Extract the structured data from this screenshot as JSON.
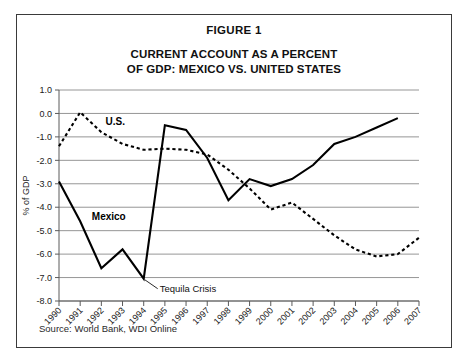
{
  "figure": {
    "label": "FIGURE 1",
    "title_line1": "CURRENT ACCOUNT AS A PERCENT",
    "title_line2": "OF GDP: MEXICO VS. UNITED STATES",
    "source": "Source: World Bank, WDI Online"
  },
  "chart_data": {
    "type": "line",
    "title": "CURRENT ACCOUNT AS A PERCENT OF GDP: MEXICO VS. UNITED STATES",
    "subtitle": "FIGURE 1",
    "xlabel": "",
    "ylabel": "% of GDP",
    "grid": true,
    "legend": "inline-series-labels",
    "ylim": [
      -8.0,
      1.0
    ],
    "ytick_labels": [
      "1.0",
      "0.0",
      "-1.0",
      "-2.0",
      "-3.0",
      "-4.0",
      "-5.0",
      "-6.0",
      "-7.0",
      "-8.0"
    ],
    "ytick_values": [
      1.0,
      0.0,
      -1.0,
      -2.0,
      -3.0,
      -4.0,
      -5.0,
      -6.0,
      -7.0,
      -8.0
    ],
    "categories": [
      "1990",
      "1991",
      "1992",
      "1993",
      "1994",
      "1995",
      "1996",
      "1997",
      "1998",
      "1999",
      "2000",
      "2001",
      "2002",
      "2003",
      "2004",
      "2005",
      "2006",
      "2007"
    ],
    "x": [
      1990,
      1991,
      1992,
      1993,
      1994,
      1995,
      1996,
      1997,
      1998,
      1999,
      2000,
      2001,
      2002,
      2003,
      2004,
      2005,
      2006,
      2007
    ],
    "series": [
      {
        "name": "Mexico",
        "style": "solid",
        "label": "Mexico",
        "values": [
          -2.9,
          -4.6,
          -6.6,
          -5.8,
          -7.05,
          -0.5,
          -0.7,
          -1.9,
          -3.7,
          -2.8,
          -3.1,
          -2.8,
          -2.2,
          -1.3,
          -1.0,
          -0.6,
          -0.2,
          null
        ]
      },
      {
        "name": "U.S.",
        "style": "dashed",
        "label": "U.S.",
        "values": [
          -1.4,
          0.05,
          -0.8,
          -1.3,
          -1.55,
          -1.5,
          -1.55,
          -1.75,
          -2.4,
          -3.2,
          -4.1,
          -3.8,
          -4.5,
          -5.2,
          -5.8,
          -6.1,
          -6.0,
          -5.3
        ]
      }
    ],
    "annotations": [
      {
        "text": "Tequila Crisis",
        "points_to_x": 1994,
        "points_to_y": -7.05
      }
    ]
  },
  "icons": {
    "leader_line": "callout-leader-line"
  },
  "colors": {
    "series_line": "#000000",
    "gridline": "#8a8a8a",
    "frame_border": "#3a3a3a",
    "text": "#111111"
  }
}
